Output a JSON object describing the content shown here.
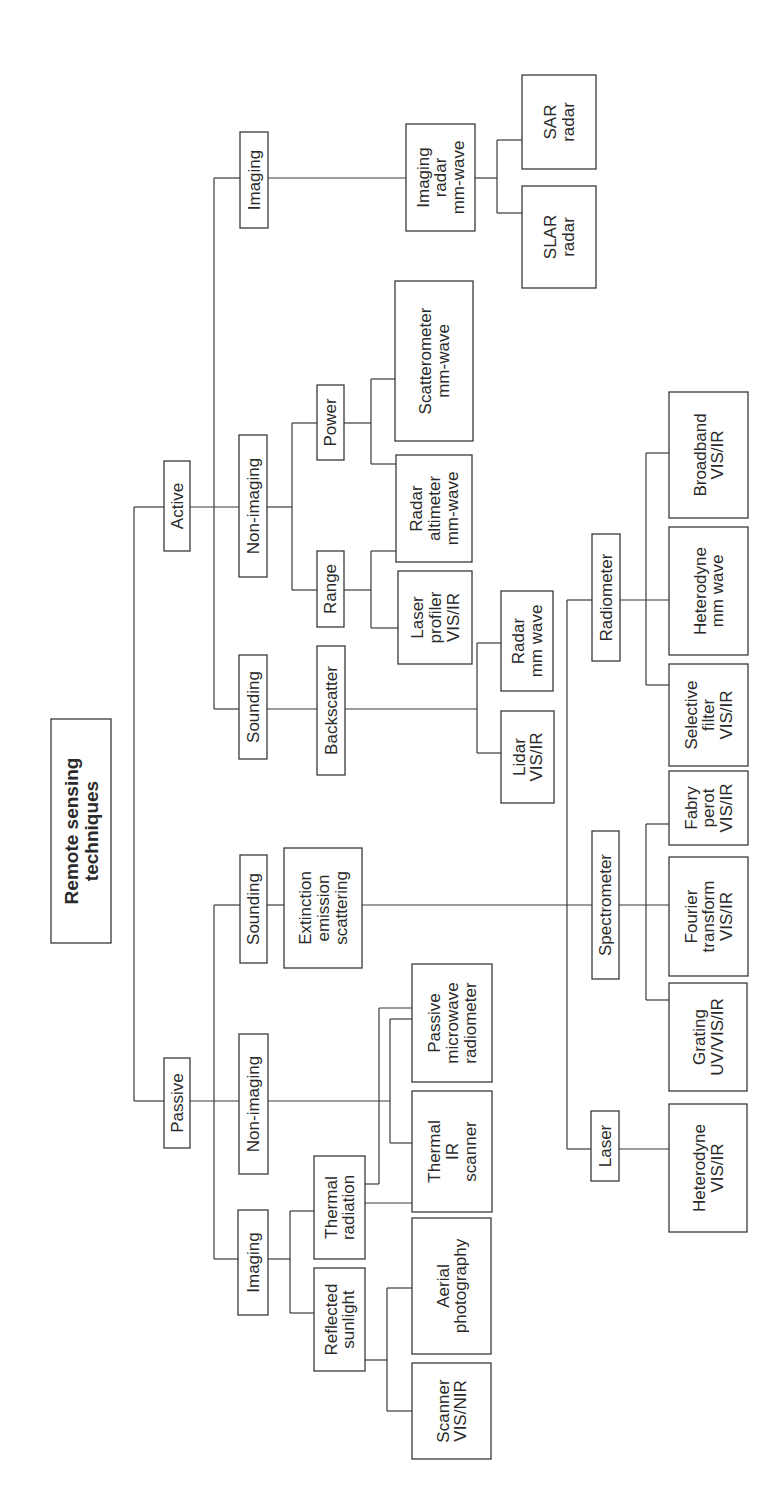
{
  "diagram": {
    "orientation": "rotated-90-ccw",
    "line_color": "#3a3a3a",
    "nodes": [
      {
        "id": "root",
        "lines": [
          "Remote sensing",
          "techniques"
        ],
        "x": 51,
        "y": 719,
        "w": 60,
        "h": 224
      },
      {
        "id": "active",
        "lines": [
          "Active"
        ],
        "x": 164,
        "y": 461,
        "w": 26,
        "h": 90
      },
      {
        "id": "passive",
        "lines": [
          "Passive"
        ],
        "x": 164,
        "y": 1058,
        "w": 26,
        "h": 90
      },
      {
        "id": "active-imaging",
        "lines": [
          "Imaging"
        ],
        "x": 240,
        "y": 132,
        "w": 28,
        "h": 96
      },
      {
        "id": "active-nonimaging",
        "lines": [
          "Non-imaging"
        ],
        "x": 239,
        "y": 435,
        "w": 28,
        "h": 142
      },
      {
        "id": "active-sounding",
        "lines": [
          "Sounding"
        ],
        "x": 239,
        "y": 655,
        "w": 28,
        "h": 104
      },
      {
        "id": "imaging-radar",
        "lines": [
          "Imaging",
          "radar",
          "mm-wave"
        ],
        "x": 406,
        "y": 124,
        "w": 69,
        "h": 107
      },
      {
        "id": "sar-radar",
        "lines": [
          "SAR",
          "radar"
        ],
        "x": 522,
        "y": 75,
        "w": 74,
        "h": 94
      },
      {
        "id": "slar-radar",
        "lines": [
          "SLAR",
          "radar"
        ],
        "x": 522,
        "y": 186,
        "w": 74,
        "h": 102
      },
      {
        "id": "power",
        "lines": [
          "Power"
        ],
        "x": 317,
        "y": 385,
        "w": 27,
        "h": 75
      },
      {
        "id": "range",
        "lines": [
          "Range"
        ],
        "x": 317,
        "y": 551,
        "w": 27,
        "h": 76
      },
      {
        "id": "scatterometer",
        "lines": [
          "Scatterometer",
          "mm-wave"
        ],
        "x": 395,
        "y": 281,
        "w": 78,
        "h": 160
      },
      {
        "id": "radar-altimeter",
        "lines": [
          "Radar",
          "altimeter",
          "mm-wave"
        ],
        "x": 396,
        "y": 455,
        "w": 76,
        "h": 107
      },
      {
        "id": "laser-profiler",
        "lines": [
          "Laser",
          "profiler",
          "VIS/IR"
        ],
        "x": 398,
        "y": 571,
        "w": 74,
        "h": 93
      },
      {
        "id": "backscatter",
        "lines": [
          "Backscatter"
        ],
        "x": 317,
        "y": 646,
        "w": 28,
        "h": 129
      },
      {
        "id": "radar-mm-wave",
        "lines": [
          "Radar",
          "mm wave"
        ],
        "x": 501,
        "y": 591,
        "w": 52,
        "h": 100
      },
      {
        "id": "lidar",
        "lines": [
          "Lidar",
          "VIS/IR"
        ],
        "x": 501,
        "y": 711,
        "w": 53,
        "h": 92
      },
      {
        "id": "passive-sounding",
        "lines": [
          "Sounding"
        ],
        "x": 240,
        "y": 855,
        "w": 27,
        "h": 108
      },
      {
        "id": "passive-nonimaging",
        "lines": [
          "Non-imaging"
        ],
        "x": 239,
        "y": 1034,
        "w": 29,
        "h": 140
      },
      {
        "id": "passive-imaging",
        "lines": [
          "Imaging"
        ],
        "x": 238,
        "y": 1210,
        "w": 30,
        "h": 105
      },
      {
        "id": "extinction",
        "lines": [
          "Extinction",
          "emission",
          "scattering"
        ],
        "x": 284,
        "y": 848,
        "w": 78,
        "h": 120
      },
      {
        "id": "radiometer",
        "lines": [
          "Radiometer"
        ],
        "x": 592,
        "y": 534,
        "w": 28,
        "h": 127
      },
      {
        "id": "spectrometer",
        "lines": [
          "Spectrometer"
        ],
        "x": 592,
        "y": 831,
        "w": 27,
        "h": 148
      },
      {
        "id": "laser",
        "lines": [
          "Laser"
        ],
        "x": 591,
        "y": 1111,
        "w": 28,
        "h": 70
      },
      {
        "id": "broadband",
        "lines": [
          "Broadband",
          "VIS/IR"
        ],
        "x": 669,
        "y": 392,
        "w": 79,
        "h": 126
      },
      {
        "id": "heterodyne-mm",
        "lines": [
          "Heterodyne",
          "mm wave"
        ],
        "x": 669,
        "y": 527,
        "w": 79,
        "h": 128
      },
      {
        "id": "selective-filter",
        "lines": [
          "Selective",
          "filter",
          "VIS/IR"
        ],
        "x": 669,
        "y": 664,
        "w": 79,
        "h": 102
      },
      {
        "id": "fabry-perot",
        "lines": [
          "Fabry",
          "perot",
          "VIS/IR"
        ],
        "x": 669,
        "y": 771,
        "w": 79,
        "h": 74
      },
      {
        "id": "fourier-transform",
        "lines": [
          "Fourier",
          "transform",
          "VIS/IR"
        ],
        "x": 669,
        "y": 857,
        "w": 79,
        "h": 119
      },
      {
        "id": "grating",
        "lines": [
          "Grating",
          "UV/VIS/IR"
        ],
        "x": 669,
        "y": 983,
        "w": 78,
        "h": 108
      },
      {
        "id": "heterodyne-visir",
        "lines": [
          "Heterodyne",
          "VIS/IR"
        ],
        "x": 669,
        "y": 1104,
        "w": 78,
        "h": 128
      },
      {
        "id": "passive-microwave",
        "lines": [
          "Passive",
          "microwave",
          "radiometer"
        ],
        "x": 412,
        "y": 964,
        "w": 80,
        "h": 118
      },
      {
        "id": "thermal-ir-scanner",
        "lines": [
          "Thermal",
          "IR",
          "scanner"
        ],
        "x": 412,
        "y": 1091,
        "w": 80,
        "h": 121
      },
      {
        "id": "thermal-radiation",
        "lines": [
          "Thermal",
          "radiation"
        ],
        "x": 314,
        "y": 1156,
        "w": 51,
        "h": 103
      },
      {
        "id": "reflected-sunlight",
        "lines": [
          "Reflected",
          "sunlight"
        ],
        "x": 314,
        "y": 1268,
        "w": 51,
        "h": 103
      },
      {
        "id": "aerial-photography",
        "lines": [
          "Aerial",
          "photography"
        ],
        "x": 412,
        "y": 1218,
        "w": 79,
        "h": 136
      },
      {
        "id": "scanner-visnir",
        "lines": [
          "Scanner",
          "VIS/NIR"
        ],
        "x": 412,
        "y": 1363,
        "w": 79,
        "h": 96
      }
    ],
    "edges": [
      [
        [
          134,
          507
        ],
        [
          164,
          507
        ]
      ],
      [
        [
          134,
          1101
        ],
        [
          164,
          1101
        ]
      ],
      [
        [
          134,
          507
        ],
        [
          134,
          1101
        ]
      ],
      [
        [
          190,
          507
        ],
        [
          239,
          507
        ]
      ],
      [
        [
          214,
          178
        ],
        [
          214,
          709
        ]
      ],
      [
        [
          214,
          178
        ],
        [
          240,
          178
        ]
      ],
      [
        [
          214,
          709
        ],
        [
          239,
          709
        ]
      ],
      [
        [
          268,
          178
        ],
        [
          406,
          178
        ]
      ],
      [
        [
          475,
          178
        ],
        [
          497,
          178
        ]
      ],
      [
        [
          497,
          140
        ],
        [
          497,
          213
        ]
      ],
      [
        [
          497,
          140
        ],
        [
          522,
          140
        ]
      ],
      [
        [
          497,
          213
        ],
        [
          522,
          213
        ]
      ],
      [
        [
          267,
          507
        ],
        [
          292,
          507
        ]
      ],
      [
        [
          292,
          423
        ],
        [
          292,
          590
        ]
      ],
      [
        [
          292,
          423
        ],
        [
          317,
          423
        ]
      ],
      [
        [
          292,
          590
        ],
        [
          317,
          590
        ]
      ],
      [
        [
          344,
          423
        ],
        [
          371,
          423
        ]
      ],
      [
        [
          371,
          379
        ],
        [
          371,
          464
        ]
      ],
      [
        [
          371,
          379
        ],
        [
          395,
          379
        ]
      ],
      [
        [
          371,
          464
        ],
        [
          396,
          464
        ]
      ],
      [
        [
          344,
          590
        ],
        [
          371,
          590
        ]
      ],
      [
        [
          371,
          551
        ],
        [
          371,
          628
        ]
      ],
      [
        [
          371,
          551
        ],
        [
          396,
          551
        ]
      ],
      [
        [
          371,
          628
        ],
        [
          398,
          628
        ]
      ],
      [
        [
          267,
          709
        ],
        [
          317,
          709
        ]
      ],
      [
        [
          345,
          709
        ],
        [
          477,
          709
        ]
      ],
      [
        [
          477,
          643
        ],
        [
          477,
          753
        ]
      ],
      [
        [
          477,
          643
        ],
        [
          501,
          643
        ]
      ],
      [
        [
          477,
          753
        ],
        [
          501,
          753
        ]
      ],
      [
        [
          190,
          1101
        ],
        [
          239,
          1101
        ]
      ],
      [
        [
          214,
          905
        ],
        [
          214,
          1259
        ]
      ],
      [
        [
          214,
          905
        ],
        [
          240,
          905
        ]
      ],
      [
        [
          214,
          1259
        ],
        [
          238,
          1259
        ]
      ],
      [
        [
          267,
          905
        ],
        [
          284,
          905
        ]
      ],
      [
        [
          362,
          905
        ],
        [
          592,
          905
        ]
      ],
      [
        [
          567,
          600
        ],
        [
          567,
          1149
        ]
      ],
      [
        [
          567,
          600
        ],
        [
          592,
          600
        ]
      ],
      [
        [
          567,
          1149
        ],
        [
          591,
          1149
        ]
      ],
      [
        [
          620,
          600
        ],
        [
          669,
          600
        ]
      ],
      [
        [
          646,
          453
        ],
        [
          646,
          685
        ]
      ],
      [
        [
          646,
          453
        ],
        [
          669,
          453
        ]
      ],
      [
        [
          646,
          685
        ],
        [
          669,
          685
        ]
      ],
      [
        [
          619,
          905
        ],
        [
          669,
          905
        ]
      ],
      [
        [
          646,
          824
        ],
        [
          646,
          1000
        ]
      ],
      [
        [
          646,
          824
        ],
        [
          669,
          824
        ]
      ],
      [
        [
          646,
          1000
        ],
        [
          669,
          1000
        ]
      ],
      [
        [
          619,
          1149
        ],
        [
          669,
          1149
        ]
      ],
      [
        [
          268,
          1101
        ],
        [
          390,
          1101
        ]
      ],
      [
        [
          390,
          1019
        ],
        [
          390,
          1143
        ]
      ],
      [
        [
          390,
          1019
        ],
        [
          412,
          1019
        ]
      ],
      [
        [
          390,
          1143
        ],
        [
          412,
          1143
        ]
      ],
      [
        [
          268,
          1259
        ],
        [
          290,
          1259
        ]
      ],
      [
        [
          290,
          1211
        ],
        [
          290,
          1313
        ]
      ],
      [
        [
          290,
          1211
        ],
        [
          314,
          1211
        ]
      ],
      [
        [
          290,
          1313
        ],
        [
          314,
          1313
        ]
      ],
      [
        [
          365,
          1184
        ],
        [
          379,
          1184
        ]
      ],
      [
        [
          379,
          1008
        ],
        [
          379,
          1184
        ]
      ],
      [
        [
          379,
          1008
        ],
        [
          412,
          1008
        ]
      ],
      [
        [
          365,
          1203
        ],
        [
          412,
          1203
        ]
      ],
      [
        [
          365,
          1360
        ],
        [
          387,
          1360
        ]
      ],
      [
        [
          387,
          1288
        ],
        [
          387,
          1411
        ]
      ],
      [
        [
          387,
          1288
        ],
        [
          412,
          1288
        ]
      ],
      [
        [
          387,
          1411
        ],
        [
          412,
          1411
        ]
      ]
    ]
  }
}
